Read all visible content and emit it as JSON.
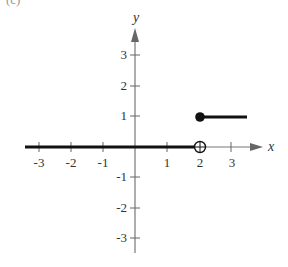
{
  "panel_label": "(c)",
  "axes": {
    "x_label": "x",
    "y_label": "y",
    "x_ticks": [
      "-3",
      "-2",
      "-1",
      "1",
      "2",
      "3"
    ],
    "y_ticks_positive": [
      "3",
      "2",
      "1"
    ],
    "y_ticks_negative": [
      "-1",
      "-2",
      "-3"
    ]
  },
  "function": {
    "description": "Step function: f(x)=0 for x<2, f(x)=1 for x>=2",
    "segments": [
      {
        "from_x": "-inf",
        "to_x": 2,
        "y": 0,
        "left_endpoint": "none",
        "right_endpoint": "open"
      },
      {
        "from_x": 2,
        "to_x": 3.5,
        "y": 1,
        "left_endpoint": "closed",
        "right_endpoint": "none"
      }
    ]
  },
  "colors": {
    "axis": "#777777",
    "curve": "#111111",
    "text": "#333333"
  }
}
